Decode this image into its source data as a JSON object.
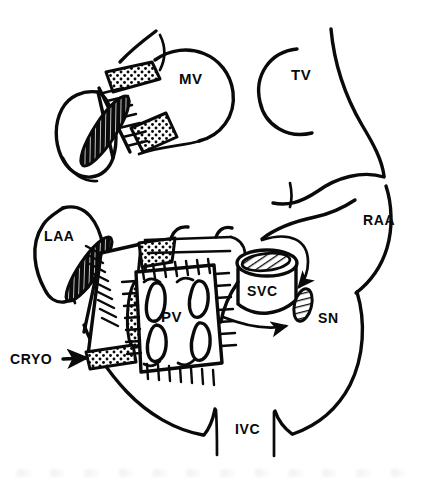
{
  "figure": {
    "ink_color": "#0a0a0a",
    "background_color": "#ffffff",
    "width": 427,
    "height": 482
  },
  "labels": {
    "mitral_valve": "MV",
    "tricuspid_valve": "TV",
    "left_atrial_appendage": "LAA",
    "right_atrial_appendage": "RAA",
    "superior_vena_cava": "SVC",
    "sinus_node": "SN",
    "pulmonary_veins": "PV",
    "inferior_vena_cava": "IVC",
    "cryoablation": "CRYO"
  },
  "label_positions": {
    "mitral_valve": {
      "x": 179,
      "y": 84
    },
    "tricuspid_valve": {
      "x": 291,
      "y": 80
    },
    "left_atrial_appendage": {
      "x": 44,
      "y": 241
    },
    "right_atrial_appendage": {
      "x": 363,
      "y": 225
    },
    "superior_vena_cava": {
      "x": 247,
      "y": 296
    },
    "sinus_node": {
      "x": 318,
      "y": 323
    },
    "pulmonary_veins": {
      "x": 161,
      "y": 322
    },
    "inferior_vena_cava": {
      "x": 235,
      "y": 434
    },
    "cryoablation": {
      "x": 10,
      "y": 364
    }
  },
  "annotations": {
    "cryo_arrow": "arrow pointing right from CRYO label to stippled cryoablation lesion",
    "svc_arrow_upper": "curved arrow descending around SVC toward sinus node",
    "svc_arrow_lower": "straight arrow pointing right toward sinus node"
  },
  "legend_notes": {
    "stippled_band": "cryoablation lesion (stippled/dotted fill)",
    "comb_hatching": "cut atrial wall edge with suture marks",
    "cross_tick_square": "pulmonary vein cuff suture line"
  }
}
